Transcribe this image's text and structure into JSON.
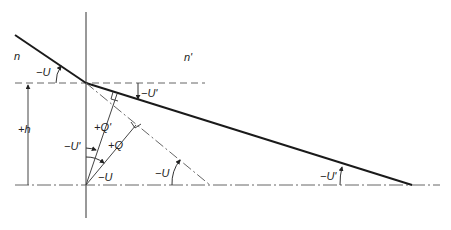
{
  "diagram": {
    "media": {
      "left": "n",
      "right": "n'"
    },
    "labels": {
      "incident_angle": "−U",
      "refracted_angle_top": "−U'",
      "height": "+h",
      "q_prime": "+Q'",
      "q": "+Q",
      "u_prime_at_axis_origin": "−U'",
      "u_at_origin": "−U",
      "u_at_dashed_intersection": "−U",
      "u_prime_at_refracted_intersection": "−U'"
    },
    "colors": {
      "line": "#1a1a1a",
      "thin": "#555555",
      "background": "#ffffff"
    }
  }
}
